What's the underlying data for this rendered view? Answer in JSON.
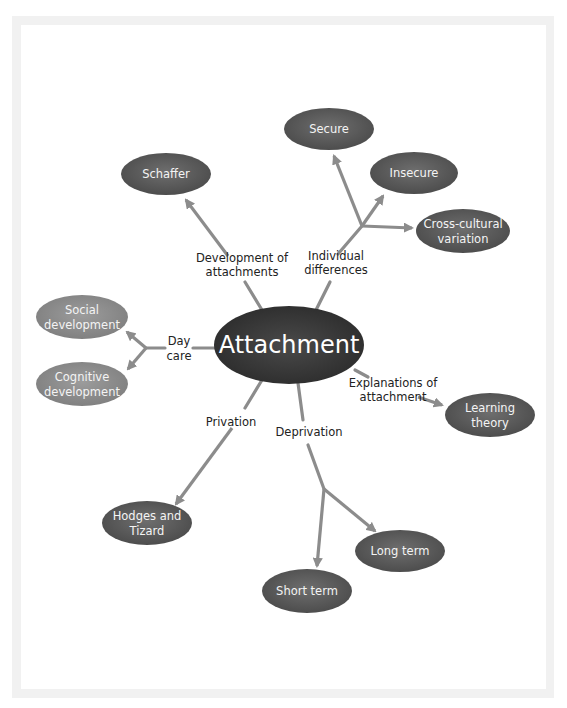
{
  "colors": {
    "node_dark": "#555555",
    "node_light": "#8a8a8a",
    "center": "#333333",
    "edge": "#8c8c8c",
    "frame": "#f1f1f1"
  },
  "center": {
    "label": "Attachment"
  },
  "branches": {
    "development": {
      "line1": "Development of",
      "line2": "attachments"
    },
    "individual": {
      "line1": "Individual",
      "line2": "differences"
    },
    "day_care": {
      "line1": "Day",
      "line2": "care"
    },
    "explanations": {
      "line1": "Explanations of",
      "line2": "attachment"
    },
    "privation": {
      "line1": "Privation"
    },
    "deprivation": {
      "line1": "Deprivation"
    }
  },
  "nodes": {
    "schaffer": {
      "line1": "Schaffer"
    },
    "secure": {
      "line1": "Secure"
    },
    "insecure": {
      "line1": "Insecure"
    },
    "cross_cultural": {
      "line1": "Cross-cultural",
      "line2": "variation"
    },
    "social": {
      "line1": "Social",
      "line2": "development"
    },
    "cognitive": {
      "line1": "Cognitive",
      "line2": "development"
    },
    "learning": {
      "line1": "Learning",
      "line2": "theory"
    },
    "hodges": {
      "line1": "Hodges and",
      "line2": "Tizard"
    },
    "long_term": {
      "line1": "Long term"
    },
    "short_term": {
      "line1": "Short term"
    }
  }
}
